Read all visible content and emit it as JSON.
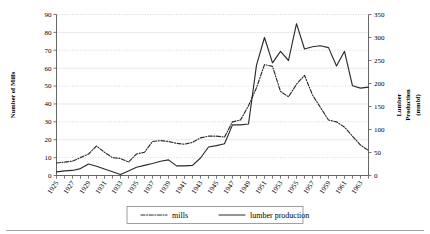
{
  "chart_data": {
    "type": "line",
    "title": "",
    "xlabel": "",
    "ylabel": "Number of Mills",
    "y2label": "Lumber Production (mmbf)",
    "ylabel_lines": [
      "Number of Mills"
    ],
    "y2label_lines": [
      "Lumber",
      "Production",
      "(mmbf)"
    ],
    "grid": true,
    "legend_position": "bottom",
    "x": [
      1925,
      1926,
      1927,
      1928,
      1929,
      1930,
      1931,
      1932,
      1933,
      1934,
      1935,
      1936,
      1937,
      1938,
      1939,
      1940,
      1941,
      1942,
      1943,
      1944,
      1945,
      1946,
      1947,
      1948,
      1949,
      1950,
      1951,
      1952,
      1953,
      1954,
      1955,
      1956,
      1957,
      1958,
      1959,
      1960,
      1961,
      1962,
      1963,
      1964
    ],
    "xtick_labels": [
      "1925",
      "1927",
      "1929",
      "1931",
      "1933",
      "1935",
      "1937",
      "1939",
      "1941",
      "1943",
      "1945",
      "1947",
      "1949",
      "1951",
      "1953",
      "1955",
      "1957",
      "1959",
      "1961",
      "1963"
    ],
    "xtick_step_labeled": 2,
    "xtick_step_minor": 1,
    "ylim": [
      0,
      90
    ],
    "yticks": [
      0,
      10,
      20,
      30,
      40,
      50,
      60,
      70,
      80,
      90
    ],
    "y2lim": [
      0,
      350
    ],
    "y2ticks": [
      0,
      50,
      100,
      150,
      200,
      250,
      300,
      350
    ],
    "series": [
      {
        "name": "mills",
        "axis": "left",
        "style": "dash-dot",
        "unit": "mills",
        "values": [
          7,
          7.5,
          8,
          10,
          12,
          16.5,
          13,
          10,
          9.5,
          7.5,
          12,
          13,
          19,
          19.5,
          19,
          18,
          17.5,
          18.5,
          21,
          22,
          22,
          21.5,
          30,
          31,
          39,
          49,
          62,
          61,
          47,
          44,
          51,
          56,
          45,
          38,
          31,
          30,
          27,
          22,
          17,
          14
        ]
      },
      {
        "name": "lumber production",
        "axis": "right",
        "style": "solid",
        "unit": "mmbf",
        "values": [
          8,
          10,
          11,
          15,
          25,
          20,
          14,
          8,
          2,
          10,
          18,
          22,
          26,
          31,
          34,
          21,
          21,
          22,
          38,
          62,
          65,
          69,
          110,
          110,
          112,
          240,
          300,
          245,
          270,
          250,
          330,
          275,
          280,
          282,
          278,
          238,
          270,
          195,
          190,
          192
        ]
      }
    ],
    "legend": [
      {
        "label": "mills",
        "style": "dash-dot"
      },
      {
        "label": "lumber production",
        "style": "solid"
      }
    ]
  }
}
